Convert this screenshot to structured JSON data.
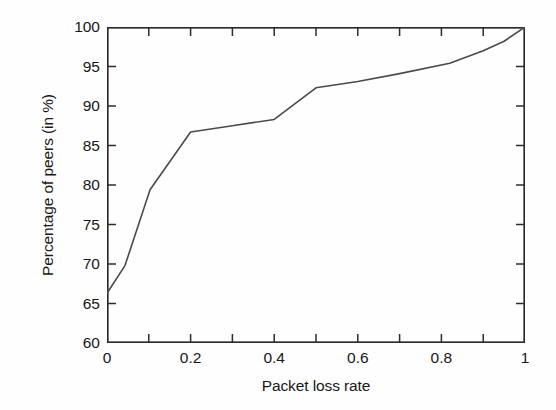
{
  "chart_data": {
    "type": "line",
    "title": "",
    "xlabel": "Packet loss rate",
    "ylabel": "Percentage of peers (in %)",
    "xlim": [
      0,
      1
    ],
    "ylim": [
      60,
      100
    ],
    "grid": false,
    "legend": null,
    "x_ticks": [
      0,
      0.2,
      0.4,
      0.6,
      0.8,
      1
    ],
    "x_tick_labels": [
      "0",
      "0.2",
      "0.4",
      "0.6",
      "0.8",
      "1"
    ],
    "x_minor_ticks": [
      0.1,
      0.3,
      0.5,
      0.7,
      0.9
    ],
    "y_ticks": [
      60,
      65,
      70,
      75,
      80,
      85,
      90,
      95,
      100
    ],
    "y_tick_labels": [
      "60",
      "65",
      "70",
      "75",
      "80",
      "85",
      "90",
      "95",
      "100"
    ],
    "line_color": "#4a4a4a",
    "line_width": 1.6,
    "series": [
      {
        "name": "CDF of packet loss rate",
        "x": [
          0,
          0.043,
          0.103,
          0.2,
          0.3,
          0.4,
          0.5,
          0.6,
          0.7,
          0.82,
          0.9,
          0.95,
          1
        ],
        "y": [
          66.3,
          69.8,
          79.4,
          86.7,
          87.5,
          88.3,
          92.3,
          93.1,
          94.1,
          95.4,
          97.0,
          98.2,
          100.0
        ]
      }
    ]
  },
  "figure": {
    "background_color": "#fefefe",
    "frame_color": "#2b2b2b"
  }
}
